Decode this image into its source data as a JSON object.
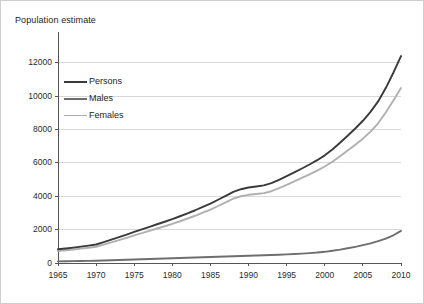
{
  "chart_data": {
    "type": "line",
    "title": "Population estimate",
    "xlabel": "",
    "ylabel": "",
    "grid": true,
    "legend_position": "upper-left-inside",
    "xlim": [
      1965,
      2010
    ],
    "ylim": [
      0,
      13000
    ],
    "xticks": [
      1965,
      1970,
      1975,
      1980,
      1985,
      1990,
      1995,
      2000,
      2005,
      2010
    ],
    "yticks": [
      0,
      2000,
      4000,
      6000,
      8000,
      10000,
      12000
    ],
    "xtick_labels": [
      "1965",
      "1970",
      "1975",
      "1980",
      "1985",
      "1990",
      "1995",
      "2000",
      "2005",
      "2010"
    ],
    "ytick_labels": [
      "0",
      "2000",
      "4000",
      "6000",
      "8000",
      "10000",
      "12000"
    ],
    "x": [
      1965,
      1966,
      1967,
      1968,
      1969,
      1970,
      1971,
      1972,
      1973,
      1974,
      1975,
      1976,
      1977,
      1978,
      1979,
      1980,
      1981,
      1982,
      1983,
      1984,
      1985,
      1986,
      1987,
      1988,
      1989,
      1990,
      1991,
      1992,
      1993,
      1994,
      1995,
      1996,
      1997,
      1998,
      1999,
      2000,
      2001,
      2002,
      2003,
      2004,
      2005,
      2006,
      2007,
      2008,
      2009,
      2010
    ],
    "series": [
      {
        "name": "Persons",
        "color": "#3a3a3a",
        "values": [
          820,
          870,
          920,
          980,
          1040,
          1110,
          1250,
          1400,
          1550,
          1700,
          1860,
          2010,
          2160,
          2320,
          2470,
          2630,
          2800,
          2980,
          3160,
          3360,
          3560,
          3790,
          4020,
          4260,
          4420,
          4520,
          4580,
          4650,
          4780,
          4980,
          5200,
          5430,
          5660,
          5900,
          6160,
          6450,
          6800,
          7200,
          7620,
          8060,
          8520,
          9050,
          9680,
          10480,
          11400,
          12400
        ]
      },
      {
        "name": "Males",
        "color": "#6e6e6e",
        "values": [
          100,
          105,
          110,
          118,
          125,
          135,
          150,
          165,
          180,
          195,
          210,
          225,
          240,
          255,
          270,
          285,
          300,
          315,
          330,
          345,
          360,
          375,
          390,
          405,
          420,
          435,
          450,
          465,
          480,
          495,
          515,
          535,
          560,
          590,
          625,
          670,
          730,
          800,
          880,
          970,
          1070,
          1180,
          1310,
          1460,
          1660,
          1920
        ]
      },
      {
        "name": "Females",
        "color": "#b0b0b0",
        "values": [
          720,
          765,
          810,
          862,
          915,
          975,
          1100,
          1235,
          1370,
          1505,
          1650,
          1785,
          1920,
          2065,
          2200,
          2345,
          2500,
          2665,
          2830,
          3015,
          3200,
          3415,
          3630,
          3855,
          4000,
          4085,
          4130,
          4185,
          4300,
          4485,
          4685,
          4895,
          5100,
          5310,
          5535,
          5780,
          6070,
          6400,
          6740,
          7090,
          7450,
          7870,
          8370,
          9020,
          9740,
          10480
        ]
      }
    ]
  },
  "legend": {
    "items": [
      {
        "label": "Persons"
      },
      {
        "label": "Males"
      },
      {
        "label": "Females"
      }
    ]
  },
  "style": {
    "axis_color": "#555555",
    "grid_color": "#d8d8d8",
    "text_color": "#1c1c1c",
    "background": "#ffffff"
  }
}
